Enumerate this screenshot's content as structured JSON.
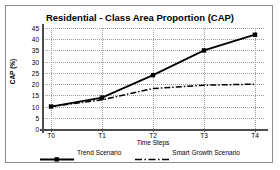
{
  "chart_data": {
    "type": "line",
    "title": "Residential  - Class Area Proportion (CAP)",
    "xlabel": "Time Steps",
    "ylabel": "CAP (%)",
    "categories": [
      "T0",
      "T1",
      "T2",
      "T3",
      "T4"
    ],
    "yticks": [
      0,
      5,
      10,
      15,
      20,
      25,
      30,
      35,
      40,
      45
    ],
    "ylim": [
      0,
      45
    ],
    "grid": true,
    "legend_position": "bottom",
    "series": [
      {
        "name": "Trend Scenario",
        "values": [
          10,
          14,
          24,
          35,
          42
        ],
        "style": "solid",
        "marker": "square",
        "color": "#000000"
      },
      {
        "name": "Smart Growth Scenario",
        "values": [
          10,
          13,
          18,
          19.5,
          20
        ],
        "style": "dash-dot",
        "marker": "none",
        "color": "#000000"
      }
    ]
  },
  "axis": {
    "y_tick_labels": [
      "45",
      "40",
      "35",
      "30",
      "25",
      "20",
      "15",
      "10",
      "5",
      "0"
    ],
    "x_tick_labels": [
      "T0",
      "T1",
      "T2",
      "T3",
      "T4"
    ]
  },
  "legend": {
    "items": [
      {
        "label": "Trend Scenario"
      },
      {
        "label": "Smart Growth Scenario"
      }
    ]
  },
  "colors": {
    "frame": "#8a8a8a",
    "axis": "#4d4d4d",
    "grid": "#9a9a9a",
    "series": "#000000",
    "background": "#ffffff"
  }
}
